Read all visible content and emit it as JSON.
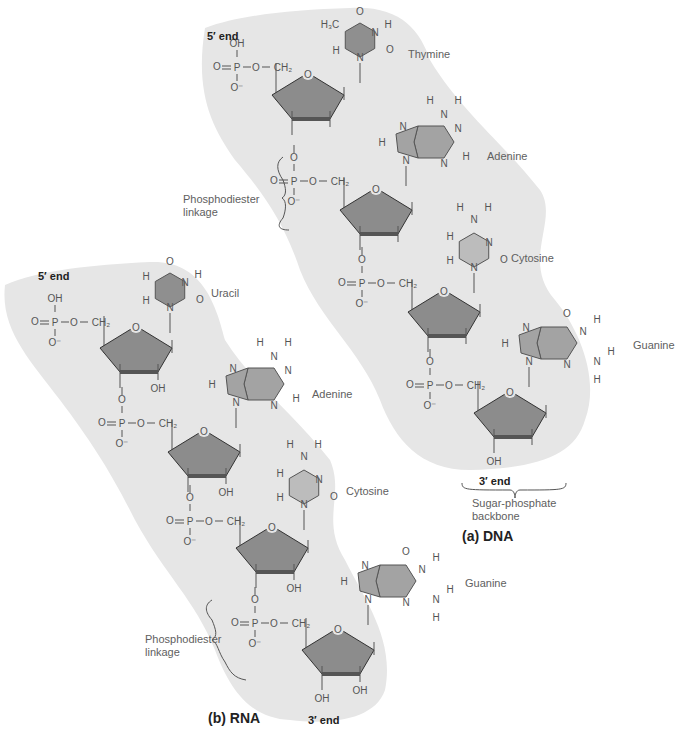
{
  "colors": {
    "backbone_shade": "#e6e6e6",
    "sugar_fill": "#8c8c8c",
    "purine_fill": "#a3a3a3",
    "pyrimidine_dark": "#8f8f8f",
    "pyrimidine_light": "#bcbcbc",
    "bond": "#555555",
    "text": "#606060"
  },
  "dna": {
    "panel_label": "(a) DNA",
    "five_prime": "5′ end",
    "three_prime": "3′ end",
    "backbone_label_line1": "Sugar-phosphate",
    "backbone_label_line2": "backbone",
    "linkage_line1": "Phosphodiester",
    "linkage_line2": "linkage",
    "bases": [
      {
        "name": "Thymine",
        "type": "pyrimidine"
      },
      {
        "name": "Adenine",
        "type": "purine"
      },
      {
        "name": "Cytosine",
        "type": "pyrimidine"
      },
      {
        "name": "Guanine",
        "type": "purine"
      }
    ],
    "sugar_3prime_group": "OH"
  },
  "rna": {
    "panel_label": "(b) RNA",
    "five_prime": "5′ end",
    "three_prime": "3′ end",
    "linkage_line1": "Phosphodiester",
    "linkage_line2": "linkage",
    "bases": [
      {
        "name": "Uracil",
        "type": "pyrimidine"
      },
      {
        "name": "Adenine",
        "type": "purine"
      },
      {
        "name": "Cytosine",
        "type": "pyrimidine"
      },
      {
        "name": "Guanine",
        "type": "purine"
      }
    ],
    "sugar_2prime_group": "OH"
  },
  "atoms": {
    "phosphate_top": "OH",
    "phosphate_P": "P",
    "phosphate_O": "O",
    "phosphate_ominus": "O⁻",
    "ch2": "CH₂",
    "methyl": "H₃C",
    "H": "H",
    "N": "N",
    "O": "O"
  }
}
